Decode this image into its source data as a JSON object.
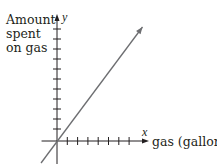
{
  "chart_data": {
    "type": "line",
    "title": "",
    "ylabel_lines": [
      "Amount",
      "spent",
      "on gas"
    ],
    "xlabel": "gas (gallons)",
    "x_axis_var": "x",
    "y_axis_var": "y",
    "x_ticks_count": 7,
    "y_ticks_count": 11,
    "tick_labels": "none",
    "xlim": [
      -1.5,
      8.7
    ],
    "ylim": [
      -2.2,
      12.6
    ],
    "grid": false,
    "series": [
      {
        "name": "cost line",
        "description": "proportional relationship through origin",
        "slope": 1.33,
        "intercept": 0,
        "x": [
          -1.55,
          8.3
        ],
        "y": [
          -2.2,
          11.4
        ],
        "arrow_end": true
      }
    ],
    "colors": {
      "axes": "#231f20",
      "line": "#6d6e71",
      "text": "#231f20"
    }
  }
}
